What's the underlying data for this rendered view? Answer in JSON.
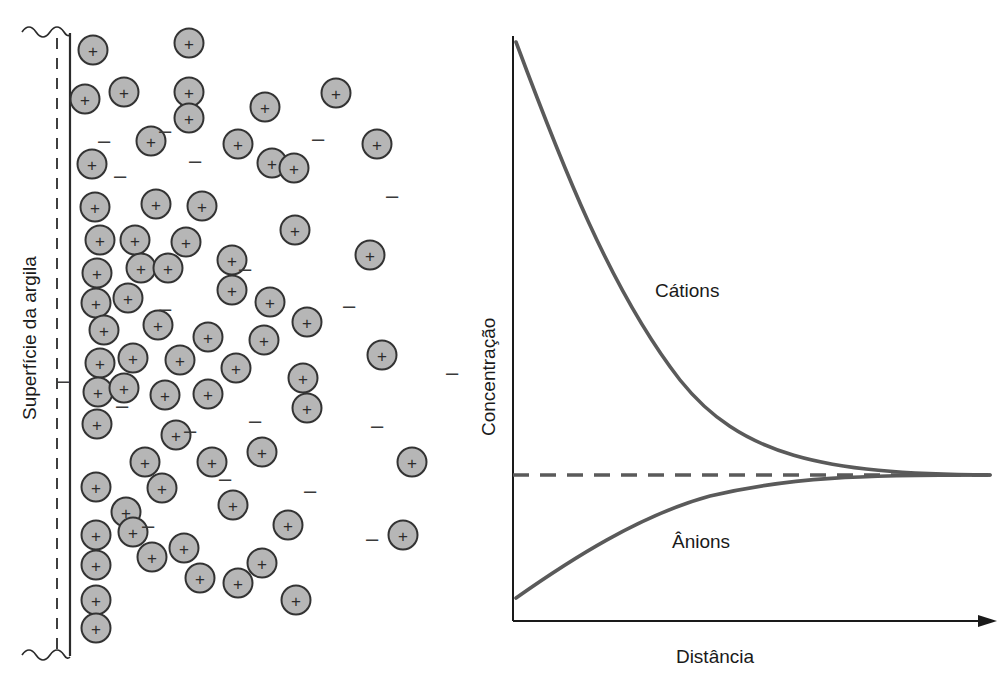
{
  "figure": {
    "left_panel": {
      "surface_label": "Superfície da argila",
      "cation_symbol": "+",
      "anion_symbol": "–",
      "solid_line_x": 70,
      "dashed_line_x": 57,
      "cations": [
        {
          "x": 93,
          "y": 50
        },
        {
          "x": 124,
          "y": 92
        },
        {
          "x": 189,
          "y": 43
        },
        {
          "x": 85,
          "y": 99
        },
        {
          "x": 265,
          "y": 107
        },
        {
          "x": 336,
          "y": 93
        },
        {
          "x": 189,
          "y": 92
        },
        {
          "x": 151,
          "y": 141
        },
        {
          "x": 189,
          "y": 118
        },
        {
          "x": 272,
          "y": 163
        },
        {
          "x": 92,
          "y": 164
        },
        {
          "x": 238,
          "y": 144
        },
        {
          "x": 377,
          "y": 144
        },
        {
          "x": 95,
          "y": 207
        },
        {
          "x": 156,
          "y": 204
        },
        {
          "x": 294,
          "y": 168
        },
        {
          "x": 100,
          "y": 240
        },
        {
          "x": 135,
          "y": 240
        },
        {
          "x": 186,
          "y": 242
        },
        {
          "x": 202,
          "y": 206
        },
        {
          "x": 97,
          "y": 273
        },
        {
          "x": 141,
          "y": 268
        },
        {
          "x": 168,
          "y": 268
        },
        {
          "x": 232,
          "y": 260
        },
        {
          "x": 295,
          "y": 230
        },
        {
          "x": 370,
          "y": 255
        },
        {
          "x": 96,
          "y": 303
        },
        {
          "x": 128,
          "y": 298
        },
        {
          "x": 232,
          "y": 290
        },
        {
          "x": 270,
          "y": 302
        },
        {
          "x": 104,
          "y": 330
        },
        {
          "x": 158,
          "y": 325
        },
        {
          "x": 208,
          "y": 337
        },
        {
          "x": 264,
          "y": 340
        },
        {
          "x": 307,
          "y": 322
        },
        {
          "x": 100,
          "y": 363
        },
        {
          "x": 133,
          "y": 358
        },
        {
          "x": 180,
          "y": 360
        },
        {
          "x": 236,
          "y": 368
        },
        {
          "x": 303,
          "y": 378
        },
        {
          "x": 382,
          "y": 355
        },
        {
          "x": 98,
          "y": 392
        },
        {
          "x": 124,
          "y": 388
        },
        {
          "x": 165,
          "y": 395
        },
        {
          "x": 208,
          "y": 394
        },
        {
          "x": 307,
          "y": 408
        },
        {
          "x": 97,
          "y": 424
        },
        {
          "x": 176,
          "y": 435
        },
        {
          "x": 145,
          "y": 462
        },
        {
          "x": 212,
          "y": 462
        },
        {
          "x": 262,
          "y": 452
        },
        {
          "x": 412,
          "y": 462
        },
        {
          "x": 96,
          "y": 487
        },
        {
          "x": 162,
          "y": 488
        },
        {
          "x": 126,
          "y": 512
        },
        {
          "x": 233,
          "y": 505
        },
        {
          "x": 96,
          "y": 535
        },
        {
          "x": 133,
          "y": 532
        },
        {
          "x": 152,
          "y": 557
        },
        {
          "x": 184,
          "y": 548
        },
        {
          "x": 288,
          "y": 525
        },
        {
          "x": 262,
          "y": 563
        },
        {
          "x": 403,
          "y": 535
        },
        {
          "x": 96,
          "y": 565
        },
        {
          "x": 200,
          "y": 578
        },
        {
          "x": 238,
          "y": 583
        },
        {
          "x": 296,
          "y": 600
        },
        {
          "x": 96,
          "y": 600
        },
        {
          "x": 96,
          "y": 628
        }
      ],
      "anions": [
        {
          "x": 165,
          "y": 130
        },
        {
          "x": 318,
          "y": 138
        },
        {
          "x": 120,
          "y": 175
        },
        {
          "x": 195,
          "y": 160
        },
        {
          "x": 392,
          "y": 195
        },
        {
          "x": 245,
          "y": 268
        },
        {
          "x": 104,
          "y": 140
        },
        {
          "x": 165,
          "y": 308
        },
        {
          "x": 349,
          "y": 305
        },
        {
          "x": 122,
          "y": 405
        },
        {
          "x": 190,
          "y": 430
        },
        {
          "x": 255,
          "y": 420
        },
        {
          "x": 377,
          "y": 425
        },
        {
          "x": 225,
          "y": 478
        },
        {
          "x": 310,
          "y": 490
        },
        {
          "x": 148,
          "y": 525
        },
        {
          "x": 372,
          "y": 538
        },
        {
          "x": 63,
          "y": 380
        },
        {
          "x": 452,
          "y": 372
        }
      ]
    },
    "chart": {
      "ylabel": "Concentração",
      "xlabel": "Distância",
      "cation_label": "Cátions",
      "anion_label": "Ânions"
    }
  },
  "chart_data": {
    "type": "line",
    "title": "",
    "xlabel": "Distância",
    "ylabel": "Concentração",
    "grid": false,
    "legend_position": "inline-labels",
    "xlim": [
      0,
      1
    ],
    "ylim": [
      0,
      1
    ],
    "annotations": [
      {
        "text": "Cátions",
        "x": 0.32,
        "y": 0.52
      },
      {
        "text": "Ânions",
        "x": 0.38,
        "y": 0.22
      }
    ],
    "reference_lines": [
      {
        "name": "bulk-concentration",
        "axis": "y",
        "value": 0.43,
        "style": "dashed"
      }
    ],
    "series": [
      {
        "name": "Cátions",
        "x": [
          0.0,
          0.05,
          0.1,
          0.15,
          0.2,
          0.25,
          0.3,
          0.35,
          0.4,
          0.45,
          0.5,
          0.6,
          0.7,
          0.8,
          0.9,
          1.0
        ],
        "y": [
          1.0,
          0.92,
          0.85,
          0.79,
          0.73,
          0.68,
          0.63,
          0.58,
          0.55,
          0.52,
          0.49,
          0.46,
          0.44,
          0.435,
          0.43,
          0.43
        ]
      },
      {
        "name": "Ânions",
        "x": [
          0.0,
          0.05,
          0.1,
          0.15,
          0.2,
          0.25,
          0.3,
          0.35,
          0.4,
          0.45,
          0.5,
          0.6,
          0.7,
          0.8,
          0.9,
          1.0
        ],
        "y": [
          0.13,
          0.17,
          0.21,
          0.25,
          0.28,
          0.31,
          0.34,
          0.36,
          0.38,
          0.395,
          0.405,
          0.42,
          0.425,
          0.428,
          0.43,
          0.43
        ]
      }
    ]
  }
}
